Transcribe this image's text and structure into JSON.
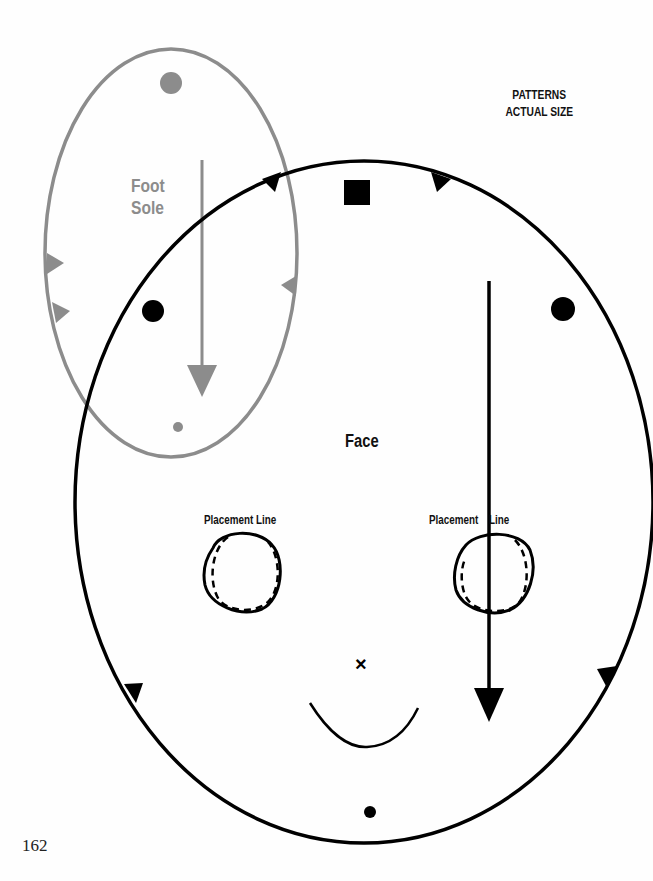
{
  "header": {
    "title_line1": "PATTERNS",
    "title_line2": "ACTUAL SIZE"
  },
  "patterns": {
    "foot_sole": {
      "label_line1": "Foot",
      "label_line2": "Sole",
      "color": "#8c8c8c"
    },
    "face": {
      "label": "Face",
      "color": "#000000",
      "placement_line_left": "Placement Line",
      "placement_line_right_a": "Placement",
      "placement_line_right_b": "Line",
      "mark_x": "×"
    }
  },
  "footer": {
    "page_number": "162"
  }
}
